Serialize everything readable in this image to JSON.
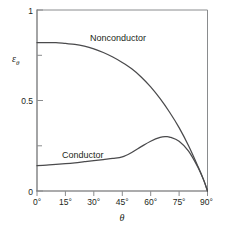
{
  "chart_data": {
    "type": "line",
    "title": "",
    "subtitle": "",
    "xlabel": "θ",
    "ylabel": "ε",
    "ylabel_subscript": "θ",
    "xlim": [
      0,
      90
    ],
    "ylim": [
      0,
      1
    ],
    "grid": false,
    "legend_position": "inline-annotations",
    "xtick_labels": [
      "0°",
      "15°",
      "30°",
      "45°",
      "60°",
      "75°",
      "90°"
    ],
    "xtick_values": [
      0,
      15,
      30,
      45,
      60,
      75,
      90
    ],
    "ytick_labels": [
      "0",
      "0.5",
      "1"
    ],
    "ytick_values": [
      0,
      0.5,
      1
    ],
    "series": [
      {
        "name": "Nonconductor",
        "label_x": 48,
        "label_y": 0.88,
        "x": [
          0,
          5,
          10,
          15,
          20,
          25,
          30,
          35,
          40,
          45,
          50,
          55,
          60,
          65,
          70,
          75,
          80,
          85,
          88,
          90
        ],
        "values": [
          0.82,
          0.82,
          0.82,
          0.815,
          0.81,
          0.8,
          0.785,
          0.765,
          0.74,
          0.71,
          0.675,
          0.63,
          0.575,
          0.51,
          0.435,
          0.35,
          0.25,
          0.135,
          0.06,
          0.0
        ]
      },
      {
        "name": "Conductor",
        "label_x": 26,
        "label_y": 0.235,
        "x": [
          0,
          5,
          10,
          15,
          20,
          25,
          30,
          35,
          40,
          45,
          50,
          55,
          60,
          65,
          68,
          70,
          75,
          80,
          85,
          88,
          90
        ],
        "values": [
          0.14,
          0.143,
          0.147,
          0.151,
          0.156,
          0.162,
          0.168,
          0.174,
          0.18,
          0.188,
          0.213,
          0.245,
          0.275,
          0.296,
          0.3,
          0.298,
          0.275,
          0.22,
          0.13,
          0.06,
          0.0
        ]
      }
    ],
    "colors": {
      "curve": "#4a4a4c",
      "axis": "#58595b",
      "frame": "#8a8c8e",
      "text": "#231f20",
      "background": "#ffffff"
    }
  }
}
